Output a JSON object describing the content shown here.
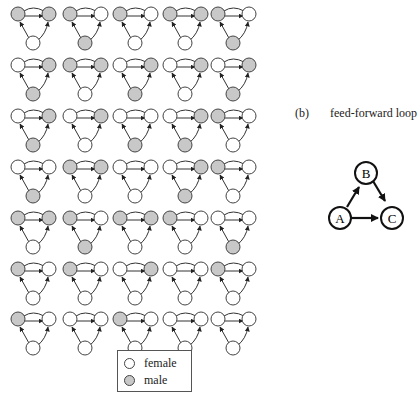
{
  "colors": {
    "male": "#c8c8c8",
    "female": "#ffffff",
    "stroke": "#333333"
  },
  "grid": {
    "columns": 5,
    "rows": 7,
    "motifs": [
      [
        "g",
        "g",
        "w"
      ],
      [
        "g",
        "w",
        "g"
      ],
      [
        "g",
        "w",
        "w"
      ],
      [
        "g",
        "g",
        "w"
      ],
      [
        "g",
        "w",
        "g"
      ],
      [
        "w",
        "g",
        "g"
      ],
      [
        "g",
        "g",
        "w"
      ],
      [
        "w",
        "g",
        "g"
      ],
      [
        "w",
        "g",
        "w"
      ],
      [
        "w",
        "g",
        "g"
      ],
      [
        "w",
        "g",
        "g"
      ],
      [
        "w",
        "g",
        "w"
      ],
      [
        "w",
        "w",
        "g"
      ],
      [
        "w",
        "g",
        "g"
      ],
      [
        "g",
        "w",
        "w"
      ],
      [
        "w",
        "w",
        "g"
      ],
      [
        "g",
        "g",
        "w"
      ],
      [
        "w",
        "w",
        "w"
      ],
      [
        "w",
        "g",
        "g"
      ],
      [
        "g",
        "w",
        "w"
      ],
      [
        "g",
        "g",
        "w"
      ],
      [
        "g",
        "w",
        "g"
      ],
      [
        "g",
        "g",
        "w"
      ],
      [
        "g",
        "w",
        "w"
      ],
      [
        "w",
        "w",
        "g"
      ],
      [
        "g",
        "w",
        "w"
      ],
      [
        "g",
        "w",
        "w"
      ],
      [
        "w",
        "g",
        "w"
      ],
      [
        "w",
        "w",
        "w"
      ],
      [
        "g",
        "w",
        "w"
      ],
      [
        "g",
        "w",
        "w"
      ],
      [
        "w",
        "w",
        "w"
      ],
      [
        "g",
        "w",
        "w"
      ],
      [
        "w",
        "w",
        "w"
      ],
      [
        "w",
        "w",
        "w"
      ]
    ]
  },
  "legend": {
    "items": [
      {
        "label": "female",
        "color": "#ffffff"
      },
      {
        "label": "male",
        "color": "#c8c8c8"
      }
    ]
  },
  "panel_b": {
    "tag": "(b)",
    "title": "feed-forward loop",
    "nodes": [
      {
        "label": "A"
      },
      {
        "label": "B"
      },
      {
        "label": "C"
      }
    ],
    "edges": [
      [
        "A",
        "B"
      ],
      [
        "B",
        "C"
      ],
      [
        "A",
        "C"
      ]
    ]
  }
}
